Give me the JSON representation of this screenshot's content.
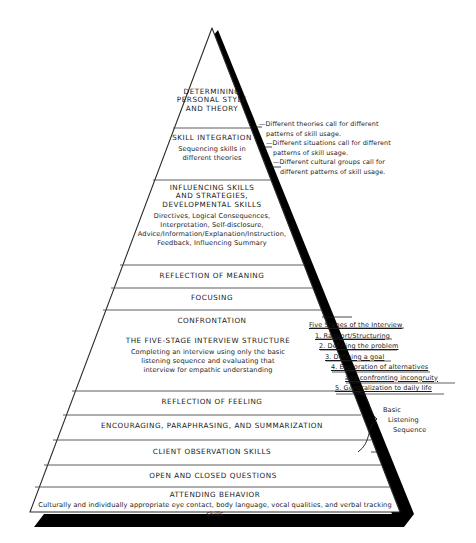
{
  "figure": {
    "name": "microskills-hierarchy-pyramid",
    "shape": "pyramid",
    "background_color": "#ffffff",
    "outline_color": "#2b2b2b",
    "shadow_color": "#000000",
    "band_fill": "#ffffff"
  },
  "pyramid": {
    "bands": [
      {
        "id": "determining-personal-style",
        "title": "DETERMINING\nPERSONAL STYLE\nAND THEORY",
        "title_lines": [
          "DETERMINING",
          "PERSONAL STYLE",
          "AND THEORY"
        ],
        "subtitle": "",
        "subtitle_lines": []
      },
      {
        "id": "skill-integration",
        "title": "SKILL INTEGRATION",
        "title_lines": [
          "SKILL INTEGRATION"
        ],
        "subtitle": "Sequencing skills in different theories",
        "subtitle_lines": [
          "Sequencing skills in",
          "different theories"
        ]
      },
      {
        "id": "influencing-skills",
        "title": "INFLUENCING SKILLS AND STRATEGIES, DEVELOPMENTAL SKILLS",
        "title_lines": [
          "INFLUENCING SKILLS",
          "AND STRATEGIES,",
          "DEVELOPMENTAL SKILLS"
        ],
        "subtitle": "Directives, Logical Consequences, Interpretation, Self-disclosure, Advice/Information/Explanation/Instruction, Feedback, Influencing Summary",
        "subtitle_lines": [
          "Directives, Logical Consequences,",
          "Interpretation, Self-disclosure,",
          "Advice/Information/Explanation/Instruction,",
          "Feedback, Influencing Summary"
        ]
      },
      {
        "id": "reflection-of-meaning",
        "title": "REFLECTION OF MEANING",
        "title_lines": [
          "REFLECTION OF MEANING"
        ],
        "subtitle": "",
        "subtitle_lines": []
      },
      {
        "id": "focusing",
        "title": "FOCUSING",
        "title_lines": [
          "FOCUSING"
        ],
        "subtitle": "",
        "subtitle_lines": []
      },
      {
        "id": "confrontation",
        "title": "CONFRONTATION",
        "title_lines": [
          "CONFRONTATION"
        ],
        "subtitle": "",
        "subtitle_lines": []
      },
      {
        "id": "five-stage-interview-structure",
        "title": "THE FIVE-STAGE INTERVIEW STRUCTURE",
        "title_lines": [
          "THE FIVE-STAGE INTERVIEW STRUCTURE"
        ],
        "subtitle": "Completing an interview using only the basic listening sequence and evaluating that interview for empathic understanding",
        "subtitle_lines": [
          "Completing an interview using only the basic",
          "listening sequence and evaluating that",
          "interview for empathic understanding"
        ]
      },
      {
        "id": "reflection-of-feeling",
        "title": "REFLECTION OF FEELING",
        "title_lines": [
          "REFLECTION OF FEELING"
        ],
        "subtitle": "",
        "subtitle_lines": []
      },
      {
        "id": "encouraging-paraphrasing-summarization",
        "title": "ENCOURAGING, PARAPHRASING, AND SUMMARIZATION",
        "title_lines": [
          "ENCOURAGING, PARAPHRASING, AND SUMMARIZATION"
        ],
        "subtitle": "",
        "subtitle_lines": []
      },
      {
        "id": "client-observation-skills",
        "title": "CLIENT OBSERVATION SKILLS",
        "title_lines": [
          "CLIENT OBSERVATION SKILLS"
        ],
        "subtitle": "",
        "subtitle_lines": []
      },
      {
        "id": "open-and-closed-questions",
        "title": "OPEN AND CLOSED QUESTIONS",
        "title_lines": [
          "OPEN AND CLOSED QUESTIONS"
        ],
        "subtitle": "",
        "subtitle_lines": []
      },
      {
        "id": "attending-behavior",
        "title": "ATTENDING BEHAVIOR",
        "title_lines": [
          "ATTENDING BEHAVIOR"
        ],
        "subtitle": "Culturally and individually appropriate eye contact, body language, vocal qualities, and verbal tracking skills",
        "subtitle_lines": [
          "Culturally and individually appropriate eye contact, body language, vocal qualities, and verbal tracking skills"
        ]
      }
    ]
  },
  "annotations": {
    "theories": {
      "name": "differing-patterns-note",
      "lines": [
        "—Different theories call for different",
        "patterns of skill usage.",
        "—Different situations call for different",
        "patterns of skill usage.",
        "—Different cultural groups call for",
        "different patterns of skill usage."
      ]
    },
    "five_stages": {
      "name": "five-stages-of-the-interview",
      "heading": "Five Stages of the Interview",
      "items": [
        "1. Rapport/Structuring",
        "2. Defining the problem",
        "3. Defining a goal",
        "4. Exploration of alternatives",
        "and confronting incongruity",
        "5. Generalization to daily life"
      ]
    },
    "basic_listening_sequence": {
      "name": "basic-listening-sequence-brace",
      "lines": [
        "Basic",
        "Listening",
        "Sequence"
      ]
    }
  }
}
